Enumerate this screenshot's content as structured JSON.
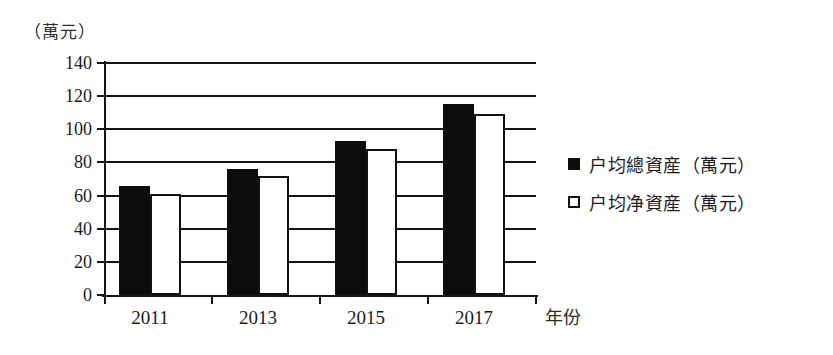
{
  "chart_data": {
    "type": "bar",
    "title": "",
    "subtitle": "",
    "xlabel": "年份",
    "ylabel": "（萬元）",
    "ylim": [
      0,
      140
    ],
    "ytick_step": 20,
    "yticks": [
      "140",
      "120",
      "100",
      "80",
      "60",
      "40",
      "20",
      "0"
    ],
    "ytick_values": [
      140,
      120,
      100,
      80,
      60,
      40,
      20,
      0
    ],
    "grid": true,
    "grid_axis": "y",
    "legend_position": "right",
    "categories": [
      "2011",
      "2013",
      "2015",
      "2017"
    ],
    "series": [
      {
        "name": "户均總資産（萬元）",
        "key": "total",
        "style": "filled",
        "color": "#0d0d0d",
        "values": [
          66,
          76,
          93,
          115
        ]
      },
      {
        "name": "户均净資産（萬元）",
        "key": "net",
        "style": "hollow",
        "color": "#ffffff",
        "border_color": "#111111",
        "values": [
          61,
          72,
          88,
          109
        ]
      }
    ]
  },
  "axes": {
    "y_unit_caption": "（萬元）",
    "x_axis_name": "年份",
    "y_tick_labels": [
      "140",
      "120",
      "100",
      "80",
      "60",
      "40",
      "20",
      "0"
    ],
    "x_tick_labels": [
      "2011",
      "2013",
      "2015",
      "2017"
    ]
  },
  "legend": {
    "items": [
      {
        "label": "户均總資産（萬元）",
        "marker": "filled-square-icon"
      },
      {
        "label": "户均净資産（萬元）",
        "marker": "hollow-square-icon"
      }
    ]
  }
}
